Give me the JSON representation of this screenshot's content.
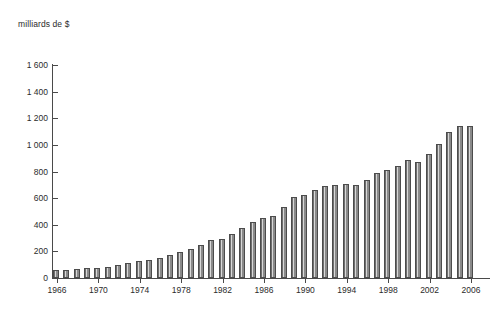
{
  "chart_data": {
    "type": "bar",
    "title": "",
    "subtitle": "",
    "ylabel": "milliards de $",
    "xlabel": "",
    "ylim": [
      0,
      1600
    ],
    "ytick_values": [
      0,
      200,
      400,
      600,
      800,
      1000,
      1200,
      1400,
      1600
    ],
    "ytick_labels": [
      "0",
      "200",
      "400",
      "600",
      "800",
      "1 000",
      "1 200",
      "1 400",
      "1 600"
    ],
    "xtick_labels": [
      "1966",
      "1970",
      "1974",
      "1978",
      "1982",
      "1986",
      "1990",
      "1994",
      "1998",
      "2002",
      "2006"
    ],
    "xtick_years": [
      1966,
      1970,
      1974,
      1978,
      1982,
      1986,
      1990,
      1994,
      1998,
      2002,
      2006
    ],
    "grid": false,
    "legend": null,
    "bar_color": "#848484",
    "bar_edge_color": "#4c4c4c",
    "axis_color": "#4a4a4a",
    "categories": [
      "1966",
      "1967",
      "1968",
      "1969",
      "1970",
      "1971",
      "1972",
      "1973",
      "1974",
      "1975",
      "1976",
      "1977",
      "1978",
      "1979",
      "1980",
      "1981",
      "1982",
      "1983",
      "1984",
      "1985",
      "1986",
      "1987",
      "1988",
      "1989",
      "1990",
      "1991",
      "1992",
      "1993",
      "1994",
      "1995",
      "1996",
      "1997",
      "1998",
      "1999",
      "2000",
      "2001",
      "2002",
      "2003",
      "2004",
      "2005",
      "2006"
    ],
    "values": [
      60,
      62,
      68,
      72,
      78,
      85,
      95,
      110,
      125,
      135,
      150,
      175,
      195,
      215,
      250,
      285,
      290,
      330,
      375,
      420,
      450,
      465,
      530,
      605,
      620,
      660,
      690,
      700,
      705,
      700,
      740,
      790,
      810,
      840,
      890,
      870,
      930,
      1010,
      1095,
      1140,
      1140
    ],
    "values_note": "milliards de $"
  }
}
